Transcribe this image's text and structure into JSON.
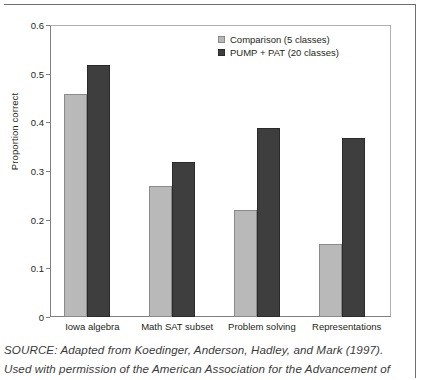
{
  "figure": {
    "source_note_lines": [
      "SOURCE: Adapted from Koedinger, Anderson, Hadley, and Mark (1997).",
      "Used with permission of the American Association for the Advancement of"
    ]
  },
  "colors": {
    "comparison": "#b9b9b9",
    "pump_pat": "#3e3e3e",
    "axis": "#808080",
    "text": "#231f20"
  },
  "chart_data": {
    "type": "bar",
    "title": "",
    "xlabel": "",
    "ylabel": "Proportion correct",
    "ylim": [
      0,
      0.6
    ],
    "ytick_labels": [
      "0",
      "0.1",
      "0.2",
      "0.3",
      "0.4",
      "0.5",
      "0.6"
    ],
    "ytick_values": [
      0,
      0.1,
      0.2,
      0.3,
      0.4,
      0.5,
      0.6
    ],
    "grid": false,
    "legend_position": "top-right",
    "categories": [
      "Iowa algebra",
      "Math SAT subset",
      "Problem solving",
      "Representations"
    ],
    "series": [
      {
        "name": "Comparison (5 classes)",
        "color": "#b9b9b9",
        "values": [
          0.46,
          0.27,
          0.22,
          0.15
        ]
      },
      {
        "name": "PUMP + PAT (20 classes)",
        "color": "#3e3e3e",
        "values": [
          0.52,
          0.32,
          0.39,
          0.37
        ]
      }
    ]
  }
}
